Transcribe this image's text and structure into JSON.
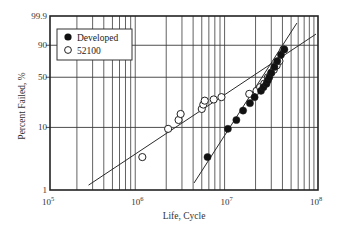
{
  "chart_data": {
    "type": "scatter",
    "title": "",
    "xlabel": "Life, Cycle",
    "ylabel": "Percent Failed, %",
    "x_scale": "log",
    "y_scale": "weibull",
    "xlim": [
      100000,
      100000000
    ],
    "ylim": [
      1,
      99.9
    ],
    "x_ticks": [
      {
        "value": 100000,
        "base": "10",
        "exp": "5"
      },
      {
        "value": 1000000,
        "base": "10",
        "exp": "6"
      },
      {
        "value": 10000000,
        "base": "10",
        "exp": "7"
      },
      {
        "value": 100000000,
        "base": "10",
        "exp": "8"
      }
    ],
    "y_ticks": [
      {
        "value": 1,
        "label": "1"
      },
      {
        "value": 10,
        "label": "10"
      },
      {
        "value": 50,
        "label": "50"
      },
      {
        "value": 90,
        "label": "90"
      },
      {
        "value": 99.9,
        "label": "99.9"
      }
    ],
    "grid": true,
    "legend_position": "upper left",
    "series": [
      {
        "name": "Developed",
        "marker": "filled-circle",
        "points": [
          [
            5800000,
            3.4
          ],
          [
            9800000,
            9.5
          ],
          [
            12200000,
            13
          ],
          [
            14500000,
            18
          ],
          [
            17300000,
            23
          ],
          [
            19500000,
            28
          ],
          [
            23000000,
            34
          ],
          [
            24500000,
            38
          ],
          [
            26500000,
            42
          ],
          [
            27500000,
            46
          ],
          [
            28500000,
            50
          ],
          [
            30000000,
            56
          ],
          [
            32500000,
            64
          ],
          [
            35000000,
            72
          ],
          [
            38500000,
            80
          ],
          [
            42000000,
            86
          ]
        ],
        "fit_line": [
          [
            4100000,
            1.3
          ],
          [
            58000000,
            99.5
          ]
        ]
      },
      {
        "name": "52100",
        "marker": "open-circle",
        "points": [
          [
            1080000,
            3.4
          ],
          [
            2100000,
            9.5
          ],
          [
            2750000,
            13
          ],
          [
            2900000,
            16
          ],
          [
            5000000,
            19
          ],
          [
            5200000,
            22
          ],
          [
            5400000,
            25
          ],
          [
            6800000,
            26
          ],
          [
            8300000,
            28
          ],
          [
            17000000,
            31
          ],
          [
            20500000,
            34
          ],
          [
            22500000,
            38
          ],
          [
            25000000,
            42
          ],
          [
            27500000,
            50
          ],
          [
            30000000,
            56
          ],
          [
            32000000,
            60
          ],
          [
            34500000,
            66
          ],
          [
            37000000,
            72
          ],
          [
            41000000,
            86
          ]
        ],
        "fit_line": [
          [
            270000,
            1.2
          ],
          [
            95000000,
            97
          ]
        ]
      }
    ]
  },
  "legend": {
    "items": [
      {
        "label": "Developed",
        "marker": "filled-circle"
      },
      {
        "label": "52100",
        "marker": "open-circle"
      }
    ]
  },
  "colors": {
    "line": "#2a2a2a",
    "grid": "#3a3a3a",
    "marker_fill": "#111111",
    "background": "#ffffff"
  }
}
